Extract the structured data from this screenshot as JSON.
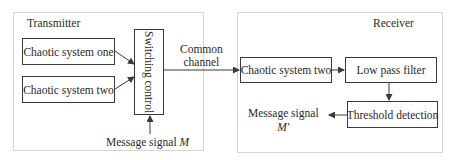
{
  "transmitter": {
    "title": "Transmitter",
    "blocks": [
      {
        "id": "chaotic-one",
        "label": "Chaotic system one"
      },
      {
        "id": "chaotic-two",
        "label": "Chaotic system two"
      },
      {
        "id": "switching",
        "label": "Switching control"
      }
    ],
    "input": {
      "label": "Message signal",
      "symbol": "M"
    }
  },
  "channel": {
    "line1": "Common",
    "line2": "channel"
  },
  "receiver": {
    "title": "Receiver",
    "blocks": [
      {
        "id": "chaotic-two-rx",
        "label": "Chaotic system two"
      },
      {
        "id": "lpf",
        "label": "Low pass filter"
      },
      {
        "id": "threshold",
        "label": "Threshold detection"
      }
    ],
    "output": {
      "label": "Message signal",
      "symbol": "M'"
    }
  },
  "colors": {
    "line": "#3a3a3a",
    "frame": "#d6d6d6"
  }
}
